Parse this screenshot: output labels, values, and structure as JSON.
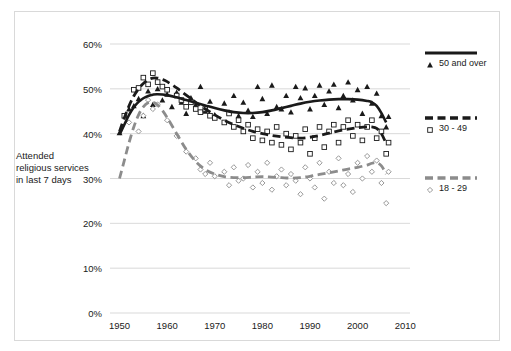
{
  "chart_data": {
    "type": "scatter",
    "title": "",
    "subtitle": "",
    "xlabel": "",
    "ylabel": "Attended religious services in last 7 days",
    "xlim": [
      1948,
      2011
    ],
    "ylim": [
      0,
      0.6
    ],
    "grid": true,
    "legend_position": "right",
    "ytick_labels": [
      "0%",
      "10%",
      "20%",
      "30%",
      "40%",
      "50%",
      "60%"
    ],
    "ytick_values": [
      0,
      10,
      20,
      30,
      40,
      50,
      60
    ],
    "xtick_labels": [
      "1950",
      "1960",
      "1970",
      "1980",
      "1990",
      "2000",
      "2010"
    ],
    "xtick_values": [
      1950,
      1960,
      1970,
      1980,
      1990,
      2000,
      2010
    ],
    "series": [
      {
        "name": "50 and over",
        "marker": "filled-triangle",
        "line_style": "solid",
        "color": "#1a1a1a",
        "trend": [
          [
            1950,
            39.8
          ],
          [
            1951,
            42.0
          ],
          [
            1952,
            44.2
          ],
          [
            1953,
            45.9
          ],
          [
            1954,
            47.1
          ],
          [
            1955,
            47.9
          ],
          [
            1956,
            48.4
          ],
          [
            1957,
            48.7
          ],
          [
            1958,
            48.8
          ],
          [
            1960,
            48.6
          ],
          [
            1962,
            48.1
          ],
          [
            1964,
            47.5
          ],
          [
            1966,
            46.9
          ],
          [
            1968,
            46.3
          ],
          [
            1970,
            45.7
          ],
          [
            1972,
            45.2
          ],
          [
            1974,
            44.8
          ],
          [
            1976,
            44.6
          ],
          [
            1978,
            44.6
          ],
          [
            1980,
            44.8
          ],
          [
            1982,
            45.2
          ],
          [
            1984,
            45.7
          ],
          [
            1986,
            46.2
          ],
          [
            1988,
            46.7
          ],
          [
            1990,
            47.1
          ],
          [
            1992,
            47.4
          ],
          [
            1994,
            47.6
          ],
          [
            1996,
            47.7
          ],
          [
            1998,
            47.7
          ],
          [
            2000,
            47.6
          ],
          [
            2002,
            47.3
          ],
          [
            2003,
            47.0
          ],
          [
            2004,
            46.2
          ],
          [
            2005,
            44.6
          ],
          [
            2006,
            42.5
          ]
        ],
        "points": [
          [
            1950,
            40.2
          ],
          [
            1952,
            45.5
          ],
          [
            1953,
            46.2
          ],
          [
            1954,
            47.8
          ],
          [
            1955,
            44.0
          ],
          [
            1956,
            49.5
          ],
          [
            1957,
            46.5
          ],
          [
            1958,
            50.0
          ],
          [
            1959,
            47.5
          ],
          [
            1960,
            48.8
          ],
          [
            1961,
            46.0
          ],
          [
            1962,
            49.2
          ],
          [
            1963,
            47.0
          ],
          [
            1964,
            44.5
          ],
          [
            1965,
            48.0
          ],
          [
            1966,
            46.5
          ],
          [
            1967,
            50.5
          ],
          [
            1968,
            45.0
          ],
          [
            1969,
            47.2
          ],
          [
            1970,
            44.2
          ],
          [
            1972,
            46.8
          ],
          [
            1973,
            44.8
          ],
          [
            1974,
            48.5
          ],
          [
            1975,
            44.0
          ],
          [
            1976,
            47.0
          ],
          [
            1977,
            45.2
          ],
          [
            1978,
            43.8
          ],
          [
            1979,
            50.5
          ],
          [
            1980,
            47.8
          ],
          [
            1981,
            44.5
          ],
          [
            1982,
            50.8
          ],
          [
            1983,
            46.0
          ],
          [
            1984,
            45.5
          ],
          [
            1985,
            48.5
          ],
          [
            1986,
            44.8
          ],
          [
            1987,
            50.5
          ],
          [
            1988,
            48.0
          ],
          [
            1989,
            50.2
          ],
          [
            1990,
            45.5
          ],
          [
            1991,
            48.5
          ],
          [
            1992,
            50.8
          ],
          [
            1993,
            46.5
          ],
          [
            1994,
            49.5
          ],
          [
            1995,
            51.0
          ],
          [
            1996,
            45.8
          ],
          [
            1997,
            48.5
          ],
          [
            1998,
            51.5
          ],
          [
            1999,
            47.5
          ],
          [
            2000,
            49.8
          ],
          [
            2001,
            44.5
          ],
          [
            2002,
            50.5
          ],
          [
            2003,
            46.8
          ],
          [
            2004,
            49.0
          ],
          [
            2005,
            44.0
          ],
          [
            2006,
            41.5
          ],
          [
            2006.5,
            43.8
          ]
        ]
      },
      {
        "name": "30 - 49",
        "marker": "open-square",
        "line_style": "dashed",
        "color": "#1a1a1a",
        "trend": [
          [
            1950,
            40.5
          ],
          [
            1951,
            43.5
          ],
          [
            1952,
            46.2
          ],
          [
            1953,
            48.4
          ],
          [
            1954,
            50.0
          ],
          [
            1955,
            51.2
          ],
          [
            1956,
            52.0
          ],
          [
            1957,
            52.4
          ],
          [
            1958,
            52.4
          ],
          [
            1959,
            52.1
          ],
          [
            1960,
            51.6
          ],
          [
            1962,
            50.2
          ],
          [
            1964,
            48.6
          ],
          [
            1966,
            47.0
          ],
          [
            1968,
            45.5
          ],
          [
            1970,
            44.2
          ],
          [
            1972,
            43.0
          ],
          [
            1974,
            42.0
          ],
          [
            1976,
            41.2
          ],
          [
            1978,
            40.5
          ],
          [
            1980,
            40.0
          ],
          [
            1982,
            39.6
          ],
          [
            1984,
            39.3
          ],
          [
            1986,
            39.1
          ],
          [
            1988,
            39.0
          ],
          [
            1990,
            39.2
          ],
          [
            1992,
            39.6
          ],
          [
            1994,
            40.1
          ],
          [
            1996,
            40.6
          ],
          [
            1998,
            41.0
          ],
          [
            2000,
            41.3
          ],
          [
            2002,
            41.5
          ],
          [
            2003,
            41.5
          ],
          [
            2004,
            41.2
          ],
          [
            2005,
            40.0
          ],
          [
            2006,
            37.8
          ]
        ],
        "points": [
          [
            1951,
            44.0
          ],
          [
            1953,
            49.8
          ],
          [
            1954,
            50.2
          ],
          [
            1955,
            52.5
          ],
          [
            1956,
            51.0
          ],
          [
            1957,
            53.5
          ],
          [
            1958,
            51.5
          ],
          [
            1959,
            50.5
          ],
          [
            1960,
            49.8
          ],
          [
            1962,
            48.5
          ],
          [
            1963,
            47.5
          ],
          [
            1964,
            46.0
          ],
          [
            1965,
            47.0
          ],
          [
            1966,
            45.5
          ],
          [
            1967,
            44.8
          ],
          [
            1968,
            45.5
          ],
          [
            1969,
            44.0
          ],
          [
            1970,
            43.5
          ],
          [
            1972,
            42.5
          ],
          [
            1973,
            44.5
          ],
          [
            1974,
            41.5
          ],
          [
            1975,
            43.0
          ],
          [
            1976,
            40.5
          ],
          [
            1977,
            42.0
          ],
          [
            1978,
            39.0
          ],
          [
            1979,
            41.0
          ],
          [
            1980,
            38.5
          ],
          [
            1981,
            40.5
          ],
          [
            1982,
            38.0
          ],
          [
            1983,
            41.5
          ],
          [
            1984,
            37.5
          ],
          [
            1985,
            40.0
          ],
          [
            1986,
            36.5
          ],
          [
            1987,
            39.5
          ],
          [
            1988,
            38.0
          ],
          [
            1989,
            41.0
          ],
          [
            1990,
            35.5
          ],
          [
            1991,
            39.0
          ],
          [
            1992,
            41.5
          ],
          [
            1993,
            37.0
          ],
          [
            1994,
            40.5
          ],
          [
            1995,
            42.0
          ],
          [
            1996,
            38.0
          ],
          [
            1997,
            41.5
          ],
          [
            1998,
            43.0
          ],
          [
            1999,
            39.5
          ],
          [
            2000,
            42.0
          ],
          [
            2001,
            38.5
          ],
          [
            2002,
            41.5
          ],
          [
            2003,
            43.0
          ],
          [
            2004,
            39.0
          ],
          [
            2005,
            40.5
          ],
          [
            2006,
            35.5
          ],
          [
            2006.5,
            38.0
          ]
        ]
      },
      {
        "name": "18 - 29",
        "marker": "open-diamond",
        "line_style": "dashed",
        "color": "#8c8c8c",
        "trend": [
          [
            1950,
            30.0
          ],
          [
            1951,
            34.0
          ],
          [
            1952,
            38.0
          ],
          [
            1953,
            41.5
          ],
          [
            1954,
            44.2
          ],
          [
            1955,
            46.0
          ],
          [
            1956,
            46.9
          ],
          [
            1957,
            47.0
          ],
          [
            1958,
            46.4
          ],
          [
            1959,
            45.2
          ],
          [
            1960,
            43.6
          ],
          [
            1962,
            40.0
          ],
          [
            1964,
            36.5
          ],
          [
            1966,
            33.8
          ],
          [
            1968,
            32.0
          ],
          [
            1970,
            31.0
          ],
          [
            1972,
            30.4
          ],
          [
            1974,
            30.2
          ],
          [
            1976,
            30.2
          ],
          [
            1978,
            30.3
          ],
          [
            1980,
            30.4
          ],
          [
            1982,
            30.3
          ],
          [
            1984,
            30.2
          ],
          [
            1986,
            30.1
          ],
          [
            1988,
            30.2
          ],
          [
            1990,
            30.5
          ],
          [
            1992,
            30.9
          ],
          [
            1994,
            31.3
          ],
          [
            1996,
            31.7
          ],
          [
            1998,
            32.1
          ],
          [
            2000,
            32.5
          ],
          [
            2002,
            33.0
          ],
          [
            2003,
            33.4
          ],
          [
            2004,
            33.5
          ],
          [
            2005,
            32.8
          ],
          [
            2006,
            31.0
          ]
        ],
        "points": [
          [
            1952,
            42.5
          ],
          [
            1954,
            40.5
          ],
          [
            1955,
            44.0
          ],
          [
            1956,
            47.5
          ],
          [
            1957,
            45.5
          ],
          [
            1958,
            46.5
          ],
          [
            1960,
            43.0
          ],
          [
            1962,
            39.5
          ],
          [
            1964,
            36.0
          ],
          [
            1966,
            34.5
          ],
          [
            1967,
            32.0
          ],
          [
            1968,
            31.0
          ],
          [
            1969,
            33.5
          ],
          [
            1970,
            30.5
          ],
          [
            1972,
            31.5
          ],
          [
            1973,
            28.5
          ],
          [
            1974,
            32.5
          ],
          [
            1975,
            29.5
          ],
          [
            1976,
            30.0
          ],
          [
            1977,
            33.0
          ],
          [
            1978,
            28.0
          ],
          [
            1979,
            31.5
          ],
          [
            1980,
            29.0
          ],
          [
            1981,
            33.5
          ],
          [
            1982,
            27.5
          ],
          [
            1983,
            30.5
          ],
          [
            1984,
            32.0
          ],
          [
            1985,
            28.5
          ],
          [
            1986,
            31.0
          ],
          [
            1987,
            29.5
          ],
          [
            1988,
            26.5
          ],
          [
            1989,
            32.5
          ],
          [
            1990,
            30.0
          ],
          [
            1991,
            28.0
          ],
          [
            1992,
            33.5
          ],
          [
            1993,
            25.5
          ],
          [
            1994,
            31.5
          ],
          [
            1995,
            29.0
          ],
          [
            1996,
            34.5
          ],
          [
            1997,
            28.5
          ],
          [
            1998,
            31.0
          ],
          [
            1999,
            27.0
          ],
          [
            2000,
            33.5
          ],
          [
            2001,
            30.0
          ],
          [
            2002,
            35.0
          ],
          [
            2003,
            31.5
          ],
          [
            2004,
            34.0
          ],
          [
            2005,
            29.0
          ],
          [
            2006,
            24.5
          ],
          [
            2006.5,
            31.5
          ]
        ]
      }
    ]
  },
  "legend": {
    "items": [
      {
        "label": "50 and over",
        "color": "#1a1a1a",
        "style": "solid",
        "marker": "filled-triangle"
      },
      {
        "label": "30 - 49",
        "color": "#1a1a1a",
        "style": "dashed",
        "marker": "open-square"
      },
      {
        "label": "18 - 29",
        "color": "#8c8c8c",
        "style": "dashed",
        "marker": "open-diamond"
      }
    ]
  },
  "axis": {
    "y_title": "Attended religious services in last 7 days"
  }
}
